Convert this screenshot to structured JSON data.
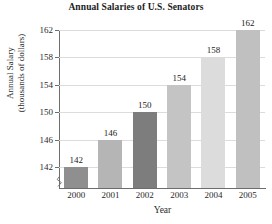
{
  "chart_data": {
    "type": "bar",
    "title": "Annual Salaries of U.S. Senators",
    "xlabel": "Year",
    "ylabel": "Annual Salary",
    "ylabel_line1": "Annual Salary",
    "ylabel_line2": "(thousands of dollars)",
    "categories": [
      "2000",
      "2001",
      "2002",
      "2003",
      "2004",
      "2005"
    ],
    "values": [
      142,
      146,
      150,
      154,
      158,
      162
    ],
    "value_labels": [
      "142",
      "146",
      "150",
      "154",
      "158",
      "162"
    ],
    "bar_colors": [
      "#8f8f8f",
      "#b5b5b5",
      "#7d7d7d",
      "#c4c4c4",
      "#dcdcdc",
      "#c0c0c0"
    ],
    "ylim": [
      140,
      162
    ],
    "yticks": [
      142,
      146,
      150,
      154,
      158,
      162
    ],
    "ytick_labels": [
      "142",
      "146",
      "150",
      "154",
      "158",
      "162"
    ],
    "grid": true,
    "grid_axis": "y",
    "legend": false,
    "axis_break": true,
    "axis_break_position": "y-bottom",
    "grid_color": "#dcdcdc",
    "axis_color": "#6d6d6d",
    "text_color": "#2b2b2b",
    "background": "#ffffff"
  }
}
